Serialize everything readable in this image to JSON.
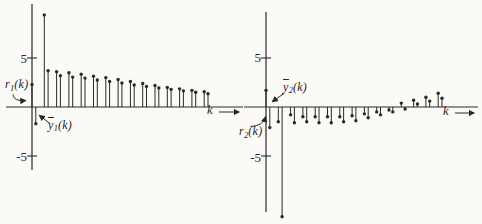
{
  "figure": {
    "ink": "#282828",
    "background": "#fbfaf7"
  },
  "plots": [
    {
      "name": "left-plot",
      "ytick_top": "5",
      "ytick_bottom": "-5",
      "xlabel": "k",
      "r_label": {
        "letter": "r",
        "sub": "1",
        "args": "(k)"
      },
      "y_label": {
        "letter": "y",
        "sub": "1",
        "args": "(k)"
      }
    },
    {
      "name": "right-plot",
      "ytick_top": "5",
      "ytick_bottom": "-5",
      "xlabel": "k",
      "r_label": {
        "letter": "r",
        "sub": "2",
        "args": "(k)"
      },
      "y_label": {
        "letter": "y",
        "sub": "2",
        "args": "(k)"
      }
    }
  ],
  "chart_data": [
    {
      "type": "stem",
      "title": "",
      "xlabel": "k",
      "ylabel": "",
      "x": [
        0,
        1,
        2,
        3,
        4,
        5,
        6,
        7,
        8,
        9,
        10,
        11,
        12,
        13,
        14
      ],
      "series": [
        {
          "name": "r1(k)",
          "values": [
            2.3,
            9.4,
            3.6,
            3.5,
            3.35,
            3.15,
            3.0,
            2.8,
            2.6,
            2.4,
            2.2,
            2.0,
            1.85,
            1.7,
            1.55
          ]
        },
        {
          "name": "ybar1(k)",
          "values": [
            -1.7,
            3.7,
            3.2,
            3.05,
            2.95,
            2.75,
            2.6,
            2.45,
            2.25,
            2.1,
            1.95,
            1.8,
            1.65,
            1.5,
            1.35
          ]
        }
      ],
      "yticks": [
        5,
        -5
      ],
      "ylim": [
        -6.4,
        10.5
      ],
      "xlim": [
        0,
        17
      ],
      "grid": false,
      "legend": "none"
    },
    {
      "type": "stem",
      "title": "",
      "xlabel": "k",
      "ylabel": "",
      "x": [
        0,
        1,
        2,
        3,
        4,
        5,
        6,
        7,
        8,
        9,
        10,
        11,
        12,
        13,
        14
      ],
      "series": [
        {
          "name": "ybar2(k)",
          "values": [
            1.7,
            -1.5,
            -0.8,
            -1.0,
            -1.0,
            -1.0,
            -1.0,
            -0.9,
            -0.7,
            -0.5,
            -0.3,
            0.4,
            0.7,
            1.0,
            1.4
          ]
        },
        {
          "name": "r2(k)",
          "values": [
            -2.1,
            -11.2,
            -1.6,
            -1.5,
            -1.6,
            -1.6,
            -1.5,
            -1.4,
            -1.1,
            -0.8,
            -0.5,
            -0.2,
            0.3,
            0.6,
            0.9
          ]
        }
      ],
      "yticks": [
        5,
        -5
      ],
      "ylim": [
        -10.7,
        9.7
      ],
      "xlim": [
        0,
        17
      ],
      "grid": false,
      "legend": "none"
    }
  ]
}
